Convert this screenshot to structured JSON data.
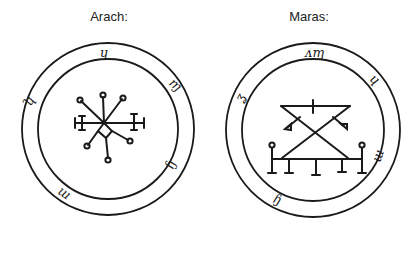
{
  "seals": [
    {
      "name": "Arach:",
      "center": [
        108,
        129
      ],
      "outer_radius": 86,
      "inner_radius": 70,
      "ring_glyphs": [
        "ɥ",
        "ɱ",
        "ɧ",
        "ɯ",
        "ʮ"
      ]
    },
    {
      "name": "Maras:",
      "center": [
        313,
        130
      ],
      "outer_radius": 87,
      "inner_radius": 71,
      "ring_glyphs": [
        "ᴧɱ",
        "ɥ",
        "ɯ",
        "ɧ",
        "ʓ"
      ]
    }
  ],
  "colors": {
    "ink": "#1a1a1a",
    "background": "#ffffff"
  }
}
